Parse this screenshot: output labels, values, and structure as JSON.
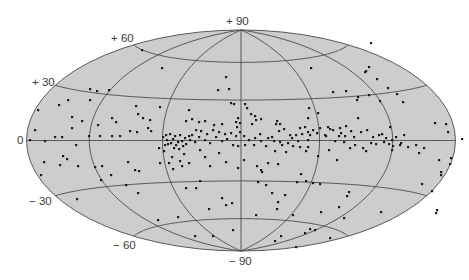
{
  "chart_data": {
    "type": "scatter",
    "projection": "hammer-aitoff (galactic coordinates)",
    "title": "",
    "xlabel": "",
    "ylabel": "",
    "grid": true,
    "legend": null,
    "latitude_ticks": [
      "+ 90",
      "+ 60",
      "+ 30",
      "0",
      "− 30",
      "− 60",
      "− 90"
    ],
    "parallels_deg": [
      -60,
      -30,
      0,
      30,
      60
    ],
    "meridians_deg": [
      -120,
      -60,
      0,
      60,
      120
    ],
    "colors": {
      "fill": "#cdcdcd",
      "outline": "#5a5a5a",
      "grid": "#4a4a4a",
      "points": "#1a1a1a"
    },
    "frame": {
      "cx": 241,
      "cy": 140.5,
      "rx": 214.5,
      "ry": 110.5
    },
    "points_px": [
      [
        142,
        50
      ],
      [
        162,
        68
      ],
      [
        97,
        91
      ],
      [
        90,
        89
      ],
      [
        109,
        90
      ],
      [
        68,
        100
      ],
      [
        90,
        100
      ],
      [
        136,
        106
      ],
      [
        160,
        107
      ],
      [
        189,
        110
      ],
      [
        226,
        77
      ],
      [
        229,
        89
      ],
      [
        218,
        90
      ],
      [
        234,
        104
      ],
      [
        231,
        103
      ],
      [
        236,
        122
      ],
      [
        238,
        118
      ],
      [
        240,
        123
      ],
      [
        237,
        127
      ],
      [
        252,
        124
      ],
      [
        251,
        114
      ],
      [
        255,
        116
      ],
      [
        256,
        120
      ],
      [
        261,
        119
      ],
      [
        277,
        121
      ],
      [
        276,
        124
      ],
      [
        280,
        124
      ],
      [
        309,
        108
      ],
      [
        308,
        118
      ],
      [
        308,
        132
      ],
      [
        308,
        140
      ],
      [
        311,
        68
      ],
      [
        371,
        43
      ],
      [
        366,
        71
      ],
      [
        365,
        72
      ],
      [
        369,
        67
      ],
      [
        377,
        79
      ],
      [
        346,
        91
      ],
      [
        358,
        97
      ],
      [
        333,
        92
      ],
      [
        369,
        95
      ],
      [
        357,
        100
      ],
      [
        380,
        101
      ],
      [
        388,
        88
      ],
      [
        397,
        94
      ],
      [
        403,
        102
      ],
      [
        435,
        123
      ],
      [
        446,
        124
      ],
      [
        448,
        132
      ],
      [
        382,
        134
      ],
      [
        390,
        127
      ],
      [
        393,
        146
      ],
      [
        392,
        150
      ],
      [
        371,
        143
      ],
      [
        358,
        118
      ],
      [
        341,
        133
      ],
      [
        318,
        113
      ],
      [
        330,
        129
      ],
      [
        325,
        135
      ],
      [
        55,
        137
      ],
      [
        62,
        137
      ],
      [
        45,
        141
      ],
      [
        72,
        128
      ],
      [
        89,
        136
      ],
      [
        100,
        136
      ],
      [
        112,
        136
      ],
      [
        120,
        136
      ],
      [
        63,
        156
      ],
      [
        60,
        165
      ],
      [
        44,
        162
      ],
      [
        41,
        175
      ],
      [
        67,
        159
      ],
      [
        76,
        145
      ],
      [
        78,
        166
      ],
      [
        95,
        167
      ],
      [
        101,
        180
      ],
      [
        111,
        175
      ],
      [
        130,
        131
      ],
      [
        137,
        132
      ],
      [
        148,
        128
      ],
      [
        151,
        131
      ],
      [
        128,
        162
      ],
      [
        135,
        170
      ],
      [
        139,
        171
      ],
      [
        160,
        163
      ],
      [
        173,
        169
      ],
      [
        184,
        154
      ],
      [
        200,
        150
      ],
      [
        205,
        157
      ],
      [
        210,
        166
      ],
      [
        219,
        153
      ],
      [
        226,
        162
      ],
      [
        238,
        168
      ],
      [
        245,
        145
      ],
      [
        244,
        160
      ],
      [
        257,
        166
      ],
      [
        261,
        170
      ],
      [
        268,
        163
      ],
      [
        275,
        151
      ],
      [
        280,
        142
      ],
      [
        286,
        152
      ],
      [
        300,
        147
      ],
      [
        306,
        151
      ],
      [
        318,
        156
      ],
      [
        329,
        150
      ],
      [
        337,
        160
      ],
      [
        350,
        148
      ],
      [
        363,
        148
      ],
      [
        366,
        151
      ],
      [
        376,
        144
      ],
      [
        384,
        142
      ],
      [
        392,
        140
      ],
      [
        401,
        143
      ],
      [
        408,
        147
      ],
      [
        416,
        145
      ],
      [
        419,
        153
      ],
      [
        424,
        148
      ],
      [
        439,
        160
      ],
      [
        441,
        172
      ],
      [
        441,
        175
      ],
      [
        450,
        164
      ],
      [
        451,
        158
      ],
      [
        462,
        139
      ],
      [
        422,
        184
      ],
      [
        432,
        191
      ],
      [
        436,
        213
      ],
      [
        437,
        210
      ],
      [
        381,
        212
      ],
      [
        344,
        218
      ],
      [
        347,
        196
      ],
      [
        308,
        147
      ],
      [
        306,
        181
      ],
      [
        278,
        164
      ],
      [
        266,
        185
      ],
      [
        262,
        172
      ],
      [
        277,
        209
      ],
      [
        281,
        236
      ],
      [
        315,
        230
      ],
      [
        321,
        212
      ],
      [
        339,
        207
      ],
      [
        349,
        192
      ],
      [
        258,
        182
      ],
      [
        285,
        195
      ],
      [
        272,
        193
      ],
      [
        278,
        202
      ],
      [
        301,
        174
      ],
      [
        297,
        182
      ],
      [
        313,
        183
      ],
      [
        320,
        184
      ],
      [
        77,
        199
      ],
      [
        138,
        193
      ],
      [
        158,
        220
      ],
      [
        178,
        217
      ],
      [
        195,
        236
      ],
      [
        213,
        236
      ],
      [
        256,
        215
      ],
      [
        275,
        241
      ],
      [
        293,
        215
      ],
      [
        296,
        247
      ],
      [
        305,
        233
      ],
      [
        310,
        229
      ],
      [
        330,
        238
      ],
      [
        233,
        230
      ],
      [
        222,
        198
      ],
      [
        232,
        203
      ],
      [
        226,
        205
      ],
      [
        209,
        209
      ],
      [
        200,
        181
      ],
      [
        196,
        188
      ],
      [
        186,
        188
      ],
      [
        189,
        163
      ],
      [
        182,
        166
      ],
      [
        180,
        161
      ],
      [
        165,
        145
      ],
      [
        159,
        148
      ],
      [
        164,
        151
      ],
      [
        172,
        157
      ],
      [
        169,
        163
      ],
      [
        126,
        185
      ],
      [
        102,
        166
      ],
      [
        245,
        104
      ],
      [
        247,
        108
      ],
      [
        260,
        134
      ],
      [
        272,
        137
      ],
      [
        290,
        135
      ],
      [
        296,
        135
      ],
      [
        302,
        134
      ],
      [
        310,
        135
      ],
      [
        317,
        133
      ],
      [
        326,
        136
      ],
      [
        339,
        136
      ],
      [
        335,
        141
      ],
      [
        344,
        142
      ],
      [
        345,
        136
      ],
      [
        354,
        137
      ],
      [
        355,
        145
      ],
      [
        361,
        132
      ],
      [
        367,
        130
      ],
      [
        373,
        137
      ],
      [
        379,
        135
      ],
      [
        386,
        138
      ],
      [
        396,
        137
      ],
      [
        404,
        135
      ],
      [
        400,
        145
      ],
      [
        389,
        144
      ],
      [
        282,
        145
      ],
      [
        288,
        143
      ],
      [
        293,
        146
      ],
      [
        266,
        146
      ],
      [
        254,
        145
      ],
      [
        249,
        140
      ],
      [
        227,
        139
      ],
      [
        222,
        141
      ],
      [
        216,
        137
      ],
      [
        210,
        143
      ],
      [
        205,
        140
      ],
      [
        199,
        137
      ],
      [
        195,
        142
      ],
      [
        190,
        140
      ],
      [
        185,
        138
      ],
      [
        178,
        142
      ],
      [
        173,
        139
      ],
      [
        167,
        140
      ],
      [
        163,
        137
      ],
      [
        166,
        135
      ],
      [
        170,
        134
      ],
      [
        175,
        136
      ],
      [
        180,
        135
      ],
      [
        182,
        141
      ],
      [
        176,
        145
      ],
      [
        171,
        143
      ],
      [
        168,
        144
      ],
      [
        174,
        148
      ],
      [
        179,
        149
      ],
      [
        183,
        146
      ],
      [
        186,
        144
      ],
      [
        189,
        136
      ],
      [
        192,
        135
      ],
      [
        196,
        130
      ],
      [
        201,
        131
      ],
      [
        207,
        134
      ],
      [
        213,
        130
      ],
      [
        219,
        132
      ],
      [
        225,
        134
      ],
      [
        231,
        133
      ],
      [
        236,
        136
      ],
      [
        240,
        132
      ],
      [
        244,
        136
      ],
      [
        233,
        145
      ],
      [
        238,
        146
      ],
      [
        255,
        138
      ],
      [
        261,
        141
      ],
      [
        268,
        138
      ],
      [
        274,
        141
      ],
      [
        279,
        131
      ],
      [
        284,
        129
      ],
      [
        300,
        128
      ],
      [
        305,
        127
      ],
      [
        313,
        130
      ],
      [
        320,
        128
      ],
      [
        328,
        127
      ],
      [
        333,
        130
      ],
      [
        340,
        128
      ],
      [
        346,
        126
      ],
      [
        351,
        131
      ],
      [
        292,
        138
      ],
      [
        298,
        141
      ],
      [
        222,
        124
      ],
      [
        214,
        125
      ],
      [
        205,
        121
      ],
      [
        199,
        122
      ],
      [
        192,
        119
      ],
      [
        186,
        121
      ],
      [
        150,
        120
      ],
      [
        143,
        118
      ],
      [
        138,
        114
      ],
      [
        116,
        122
      ],
      [
        112,
        118
      ],
      [
        98,
        125
      ],
      [
        82,
        121
      ],
      [
        72,
        117
      ],
      [
        59,
        105
      ],
      [
        38,
        110
      ],
      [
        35,
        130
      ],
      [
        30,
        140
      ]
    ]
  }
}
